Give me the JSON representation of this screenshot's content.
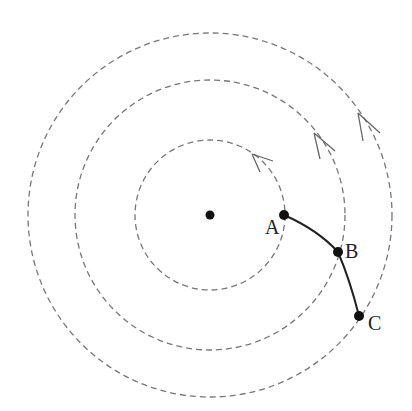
{
  "diagram": {
    "center": {
      "x": 210,
      "y": 215
    },
    "circles": [
      {
        "name": "inner",
        "radius": 75
      },
      {
        "name": "middle",
        "radius": 135
      },
      {
        "name": "outer",
        "radius": 182
      }
    ],
    "points": [
      {
        "label": "A",
        "x": 284,
        "y": 215
      },
      {
        "label": "B",
        "x": 338,
        "y": 252
      },
      {
        "label": "C",
        "x": 359,
        "y": 316
      }
    ],
    "arrows": [
      {
        "on": "inner",
        "x": 253,
        "y": 153
      },
      {
        "on": "middle",
        "x": 316,
        "y": 133
      },
      {
        "on": "outer",
        "x": 360,
        "y": 113
      }
    ]
  },
  "labels": {
    "a": "A",
    "b": "B",
    "c": "C"
  }
}
